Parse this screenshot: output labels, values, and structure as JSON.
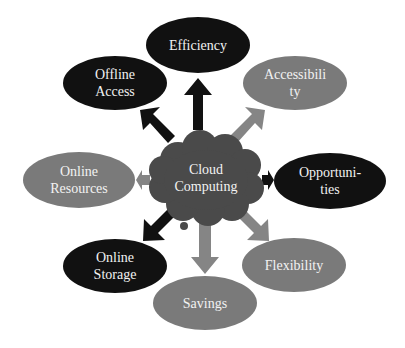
{
  "diagram": {
    "center": {
      "label_line1": "Cloud",
      "label_line2": "Computing",
      "color": "#4a4a4a"
    },
    "nodes": [
      {
        "id": "efficiency",
        "line1": "Efficiency",
        "line2": "",
        "color": "#111111"
      },
      {
        "id": "accessibility",
        "line1": "Accessibili",
        "line2": "ty",
        "color": "#7a7a7a"
      },
      {
        "id": "opportunities",
        "line1": "Opportuni-",
        "line2": "ties",
        "color": "#111111"
      },
      {
        "id": "flexibility",
        "line1": "Flexibility",
        "line2": "",
        "color": "#7a7a7a"
      },
      {
        "id": "savings",
        "line1": "Savings",
        "line2": "",
        "color": "#7a7a7a"
      },
      {
        "id": "online-storage",
        "line1": "Online",
        "line2": "Storage",
        "color": "#111111"
      },
      {
        "id": "online-resources",
        "line1": "Online",
        "line2": "Resources",
        "color": "#7a7a7a"
      },
      {
        "id": "offline-access",
        "line1": "Offline",
        "line2": "Access",
        "color": "#111111"
      }
    ],
    "colors": {
      "dark": "#111111",
      "gray": "#7a7a7a",
      "cloud": "#4a4a4a",
      "background": "#ffffff"
    }
  }
}
